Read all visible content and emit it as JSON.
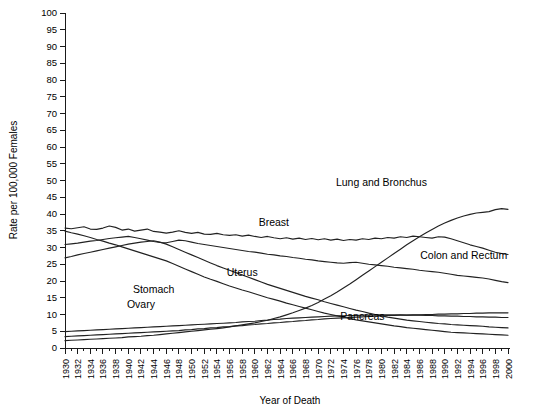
{
  "chart_data": {
    "type": "line",
    "title": "",
    "subtitle": "",
    "xlabel": "Year of Death",
    "ylabel": "Rate per 100,000 Females",
    "xlim": [
      1930,
      2000
    ],
    "ylim": [
      0,
      100
    ],
    "ytick_step": 5,
    "xtick_step": 2,
    "x_minor_tick_step": 1,
    "grid": false,
    "legend": "inline-labels",
    "legend_position": "inline",
    "yticks": [
      0,
      5,
      10,
      15,
      20,
      25,
      30,
      35,
      40,
      45,
      50,
      55,
      60,
      65,
      70,
      75,
      80,
      85,
      90,
      95,
      100
    ],
    "xticks": [
      1930,
      1932,
      1934,
      1936,
      1938,
      1940,
      1942,
      1944,
      1946,
      1948,
      1950,
      1952,
      1954,
      1956,
      1958,
      1960,
      1962,
      1964,
      1966,
      1968,
      1970,
      1972,
      1974,
      1976,
      1978,
      1980,
      1982,
      1984,
      1986,
      1988,
      1990,
      1992,
      1994,
      1996,
      1998,
      2000
    ],
    "x": [
      1930,
      1931,
      1932,
      1933,
      1934,
      1935,
      1936,
      1937,
      1938,
      1939,
      1940,
      1941,
      1942,
      1943,
      1944,
      1945,
      1946,
      1947,
      1948,
      1949,
      1950,
      1951,
      1952,
      1953,
      1954,
      1955,
      1956,
      1957,
      1958,
      1959,
      1960,
      1961,
      1962,
      1963,
      1964,
      1965,
      1966,
      1967,
      1968,
      1969,
      1970,
      1971,
      1972,
      1973,
      1974,
      1975,
      1976,
      1977,
      1978,
      1979,
      1980,
      1981,
      1982,
      1983,
      1984,
      1985,
      1986,
      1987,
      1988,
      1989,
      1990,
      1991,
      1992,
      1993,
      1994,
      1995,
      1996,
      1997,
      1998,
      1999,
      2000
    ],
    "series": [
      {
        "name": "Lung and Bronchus",
        "label": "Lung and Bronchus",
        "label_x": 1980,
        "label_y": 48.5,
        "values": [
          2.2,
          2.3,
          2.4,
          2.5,
          2.6,
          2.7,
          2.8,
          2.9,
          3.0,
          3.1,
          3.3,
          3.4,
          3.5,
          3.7,
          3.8,
          4.0,
          4.2,
          4.4,
          4.6,
          4.8,
          5.0,
          5.2,
          5.4,
          5.6,
          5.8,
          6.0,
          6.3,
          6.6,
          6.9,
          7.2,
          7.5,
          7.9,
          8.3,
          8.8,
          9.3,
          9.9,
          10.5,
          11.2,
          11.9,
          12.7,
          13.6,
          14.6,
          15.6,
          16.7,
          17.9,
          19.1,
          20.4,
          21.7,
          23.0,
          24.3,
          25.6,
          26.9,
          28.2,
          29.5,
          30.8,
          32.0,
          33.2,
          34.3,
          35.4,
          36.4,
          37.3,
          38.1,
          38.8,
          39.4,
          39.9,
          40.3,
          40.5,
          40.7,
          41.3,
          41.6,
          41.4
        ]
      },
      {
        "name": "Breast",
        "label": "Breast",
        "label_x": 1963,
        "label_y": 36.5,
        "values": [
          35.8,
          35.6,
          35.9,
          36.2,
          35.5,
          35.4,
          35.8,
          36.4,
          36.0,
          35.2,
          35.5,
          34.9,
          35.2,
          35.5,
          34.8,
          34.6,
          34.3,
          34.6,
          35.0,
          34.5,
          34.2,
          34.5,
          34.0,
          33.9,
          34.2,
          33.8,
          33.6,
          33.8,
          33.4,
          33.7,
          33.3,
          33.0,
          33.3,
          32.9,
          32.6,
          32.9,
          32.5,
          32.8,
          32.4,
          32.7,
          32.3,
          32.6,
          32.2,
          32.5,
          32.1,
          32.4,
          32.2,
          32.6,
          32.4,
          32.8,
          32.6,
          33.0,
          32.8,
          33.2,
          33.0,
          33.4,
          33.2,
          33.0,
          32.8,
          33.2,
          33.1,
          32.6,
          32.0,
          31.4,
          30.8,
          30.3,
          29.8,
          29.2,
          28.6,
          28.2,
          27.9
        ]
      },
      {
        "name": "Colon and Rectum",
        "label": "Colon and Rectum",
        "label_x": 1993,
        "label_y": 26.5,
        "values": [
          30.9,
          31.1,
          31.3,
          31.6,
          31.9,
          32.1,
          32.4,
          32.7,
          32.9,
          33.1,
          33.3,
          33.0,
          32.6,
          32.2,
          31.8,
          31.5,
          31.4,
          31.8,
          32.2,
          32.0,
          31.6,
          31.2,
          30.9,
          30.6,
          30.3,
          30.0,
          29.7,
          29.4,
          29.1,
          28.8,
          28.6,
          28.3,
          28.0,
          27.8,
          27.5,
          27.3,
          27.0,
          26.8,
          26.5,
          26.3,
          26.0,
          25.8,
          25.6,
          25.4,
          25.3,
          25.5,
          25.6,
          25.3,
          25.0,
          24.8,
          24.6,
          24.4,
          24.1,
          23.9,
          23.7,
          23.5,
          23.2,
          23.0,
          22.8,
          22.6,
          22.3,
          22.0,
          21.7,
          21.5,
          21.3,
          21.1,
          20.9,
          20.6,
          20.2,
          19.8,
          19.5
        ]
      },
      {
        "name": "Stomach",
        "label": "Stomach",
        "label_x": 1944,
        "label_y": 16.5,
        "values": [
          34.9,
          34.4,
          34.0,
          33.5,
          33.0,
          32.4,
          31.9,
          31.3,
          30.8,
          30.2,
          29.6,
          29.0,
          28.4,
          27.8,
          27.2,
          26.6,
          26.0,
          25.2,
          24.4,
          23.6,
          22.8,
          22.0,
          21.2,
          20.5,
          19.9,
          19.2,
          18.5,
          17.9,
          17.3,
          16.8,
          16.2,
          15.6,
          15.0,
          14.5,
          14.0,
          13.4,
          12.9,
          12.4,
          11.9,
          11.4,
          10.9,
          10.4,
          10.0,
          9.6,
          9.2,
          8.8,
          8.4,
          8.1,
          7.8,
          7.5,
          7.2,
          6.9,
          6.6,
          6.4,
          6.1,
          5.9,
          5.7,
          5.5,
          5.3,
          5.1,
          4.9,
          4.7,
          4.6,
          4.5,
          4.4,
          4.3,
          4.2,
          4.1,
          4.0,
          3.9,
          3.8
        ]
      },
      {
        "name": "Uterus",
        "label": "Uterus",
        "label_x": 1958,
        "label_y": 21.5,
        "values": [
          26.9,
          27.3,
          27.8,
          28.2,
          28.6,
          29.0,
          29.4,
          29.8,
          30.2,
          30.6,
          31.0,
          31.3,
          31.6,
          31.8,
          32.0,
          31.6,
          31.0,
          30.2,
          29.4,
          28.6,
          27.8,
          27.0,
          26.2,
          25.4,
          24.6,
          23.9,
          23.2,
          22.5,
          21.8,
          21.1,
          20.4,
          19.7,
          19.0,
          18.4,
          17.8,
          17.2,
          16.6,
          16.0,
          15.4,
          14.9,
          14.4,
          13.8,
          13.3,
          12.8,
          12.3,
          11.8,
          11.3,
          10.9,
          10.4,
          10.0,
          9.6,
          9.2,
          8.9,
          8.6,
          8.3,
          8.1,
          7.9,
          7.7,
          7.5,
          7.3,
          7.2,
          7.0,
          6.9,
          6.8,
          6.7,
          6.6,
          6.5,
          6.3,
          6.2,
          6.1,
          6.0
        ]
      },
      {
        "name": "Ovary",
        "label": "Ovary",
        "label_x": 1942,
        "label_y": 12.0,
        "values": [
          4.9,
          5.0,
          5.1,
          5.2,
          5.3,
          5.4,
          5.5,
          5.6,
          5.7,
          5.8,
          5.9,
          6.0,
          6.1,
          6.2,
          6.3,
          6.4,
          6.5,
          6.6,
          6.7,
          6.8,
          6.9,
          7.0,
          7.1,
          7.2,
          7.3,
          7.4,
          7.5,
          7.6,
          7.8,
          7.9,
          8.0,
          8.2,
          8.3,
          8.5,
          8.6,
          8.8,
          8.9,
          9.0,
          9.1,
          9.2,
          9.3,
          9.4,
          9.5,
          9.6,
          9.6,
          9.7,
          9.7,
          9.8,
          9.8,
          9.9,
          9.9,
          9.9,
          9.9,
          9.9,
          9.8,
          9.8,
          9.8,
          9.7,
          9.7,
          9.6,
          9.6,
          9.5,
          9.5,
          9.4,
          9.4,
          9.3,
          9.3,
          9.2,
          9.2,
          9.1,
          9.1
        ]
      },
      {
        "name": "Pancreas",
        "label": "Pancreas",
        "label_x": 1977,
        "label_y": 8.3,
        "values": [
          3.4,
          3.5,
          3.6,
          3.7,
          3.8,
          3.9,
          4.0,
          4.1,
          4.2,
          4.3,
          4.4,
          4.5,
          4.6,
          4.7,
          4.8,
          4.9,
          5.0,
          5.1,
          5.2,
          5.4,
          5.5,
          5.7,
          5.8,
          6.0,
          6.1,
          6.3,
          6.4,
          6.6,
          6.7,
          6.9,
          7.0,
          7.2,
          7.3,
          7.5,
          7.6,
          7.8,
          7.9,
          8.1,
          8.2,
          8.4,
          8.5,
          8.7,
          8.8,
          8.9,
          9.0,
          9.1,
          9.2,
          9.3,
          9.4,
          9.5,
          9.6,
          9.7,
          9.7,
          9.8,
          9.8,
          9.9,
          9.9,
          10.0,
          10.0,
          10.1,
          10.1,
          10.2,
          10.2,
          10.3,
          10.3,
          10.4,
          10.4,
          10.5,
          10.5,
          10.5,
          10.5
        ]
      }
    ]
  }
}
